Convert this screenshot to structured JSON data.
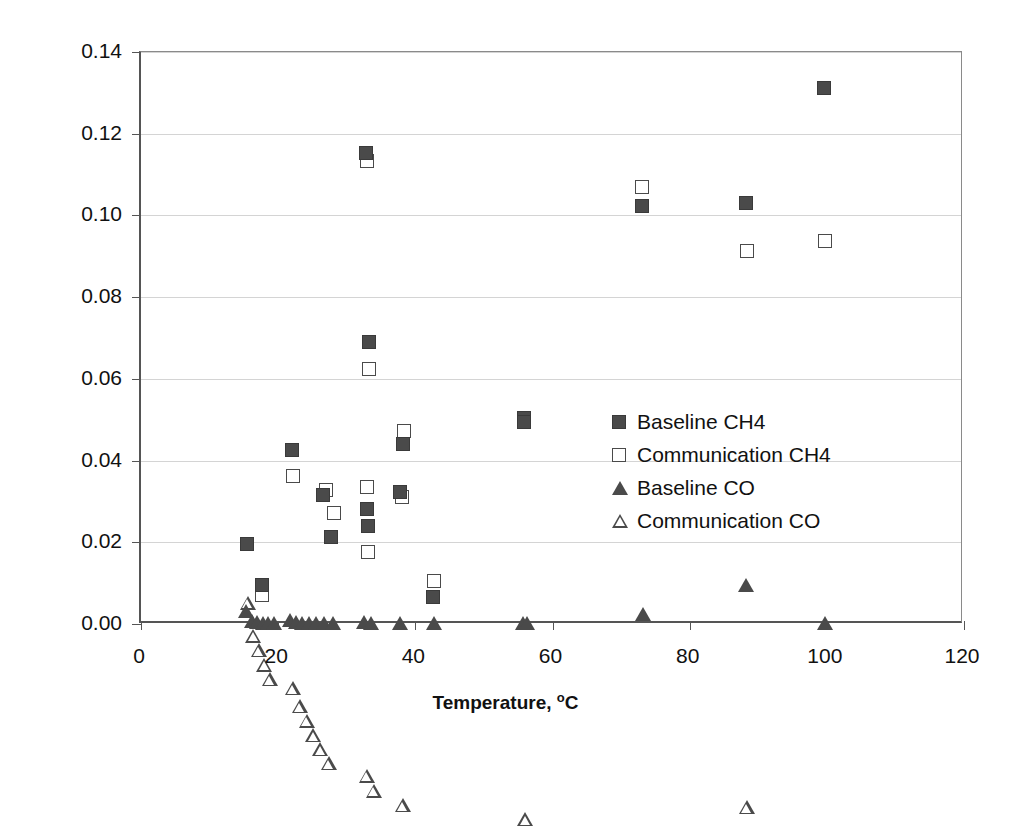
{
  "chart_data": {
    "type": "scatter",
    "title": "",
    "xlabel": "Temperature, °C",
    "ylabel": "Concentration, %",
    "xlim": [
      0,
      120
    ],
    "ylim": [
      0.0,
      0.14
    ],
    "xticks": [
      "0",
      "20",
      "40",
      "60",
      "80",
      "100",
      "120"
    ],
    "xtick_values": [
      0,
      20,
      40,
      60,
      80,
      100,
      120
    ],
    "yticks": [
      "0.00",
      "0.02",
      "0.04",
      "0.06",
      "0.08",
      "0.10",
      "0.12",
      "0.14"
    ],
    "ytick_values": [
      0.0,
      0.02,
      0.04,
      0.06,
      0.08,
      0.1,
      0.12,
      0.14
    ],
    "grid": "horizontal",
    "legend_position": "center-right",
    "series": [
      {
        "name": "Baseline CH4",
        "marker": "filled-square",
        "color": "#4a4a4a",
        "points": [
          [
            15.4,
            0.0195
          ],
          [
            17.6,
            0.0095
          ],
          [
            22.0,
            0.0425
          ],
          [
            26.5,
            0.0315
          ],
          [
            27.7,
            0.0212
          ],
          [
            32.8,
            0.1152
          ],
          [
            33.2,
            0.069
          ],
          [
            33.0,
            0.0282
          ],
          [
            33.1,
            0.024
          ],
          [
            38.2,
            0.044
          ],
          [
            37.8,
            0.0322
          ],
          [
            42.6,
            0.0065
          ],
          [
            55.8,
            0.0505
          ],
          [
            55.9,
            0.0495
          ],
          [
            73.0,
            0.1022
          ],
          [
            88.2,
            0.103
          ],
          [
            99.6,
            0.1312
          ]
        ]
      },
      {
        "name": "Communication CH4",
        "marker": "open-square",
        "color": "#4a4a4a",
        "points": [
          [
            17.7,
            0.0072
          ],
          [
            22.1,
            0.0362
          ],
          [
            27.0,
            0.0328
          ],
          [
            28.2,
            0.0272
          ],
          [
            32.9,
            0.1132
          ],
          [
            33.3,
            0.0625
          ],
          [
            32.9,
            0.0335
          ],
          [
            33.1,
            0.0176
          ],
          [
            38.3,
            0.0472
          ],
          [
            38.0,
            0.031
          ],
          [
            42.7,
            0.0105
          ],
          [
            73.1,
            0.107
          ],
          [
            88.3,
            0.0912
          ],
          [
            99.7,
            0.0938
          ]
        ]
      },
      {
        "name": "Baseline CO",
        "marker": "filled-triangle",
        "color": "#4a4a4a",
        "points": [
          [
            15.2,
            0.0032
          ],
          [
            16.0,
            0.0008
          ],
          [
            16.8,
            0.0004
          ],
          [
            17.6,
            0.0003
          ],
          [
            18.4,
            0.0002
          ],
          [
            19.2,
            0.0002
          ],
          [
            21.6,
            0.001
          ],
          [
            22.4,
            0.0006
          ],
          [
            23.4,
            0.0003
          ],
          [
            24.4,
            0.0002
          ],
          [
            25.4,
            0.0002
          ],
          [
            26.6,
            0.0002
          ],
          [
            27.8,
            0.0002
          ],
          [
            32.4,
            0.0004
          ],
          [
            33.4,
            0.0003
          ],
          [
            37.6,
            0.0002
          ],
          [
            42.6,
            0.0002
          ],
          [
            55.6,
            0.0002
          ],
          [
            56.2,
            0.0002
          ],
          [
            73.0,
            0.0025
          ],
          [
            88.0,
            0.0095
          ],
          [
            99.6,
            0.0002
          ]
        ]
      },
      {
        "name": "Communication CO",
        "marker": "open-triangle",
        "color": "#4a4a4a",
        "points": [
          [
            15.4,
            0.0052
          ],
          [
            16.2,
            0.0006
          ],
          [
            17.0,
            0.0004
          ],
          [
            17.8,
            0.0003
          ],
          [
            18.6,
            0.0002
          ],
          [
            22.0,
            0.0014
          ],
          [
            23.0,
            0.0004
          ],
          [
            24.0,
            0.0003
          ],
          [
            25.0,
            0.0002
          ],
          [
            26.0,
            0.0002
          ],
          [
            27.2,
            0.0002
          ],
          [
            32.8,
            0.0005
          ],
          [
            33.8,
            0.0003
          ],
          [
            38.0,
            0.0002
          ],
          [
            55.9,
            0.0002
          ],
          [
            88.2,
            0.0065
          ]
        ]
      }
    ]
  },
  "axis": {
    "y_title_main": "Concentration, %",
    "x_title_main": "Temperature, ",
    "x_title_sup": "o",
    "x_title_tail": "C"
  },
  "legend": {
    "items": [
      {
        "label": "Baseline CH4",
        "marker": "filled-square"
      },
      {
        "label": "Communication CH4",
        "marker": "open-square"
      },
      {
        "label": "Baseline CO",
        "marker": "filled-triangle"
      },
      {
        "label": "Communication CO",
        "marker": "open-triangle"
      }
    ]
  }
}
